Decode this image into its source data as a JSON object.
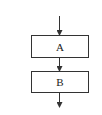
{
  "diagram": {
    "type": "flowchart",
    "nodes": [
      {
        "id": "A",
        "label": "A"
      },
      {
        "id": "B",
        "label": "B"
      }
    ],
    "edges": [
      {
        "from": "start",
        "to": "A"
      },
      {
        "from": "A",
        "to": "B"
      },
      {
        "from": "B",
        "to": "end"
      }
    ],
    "colors": {
      "stroke": "#333333",
      "background": "#ffffff"
    }
  }
}
